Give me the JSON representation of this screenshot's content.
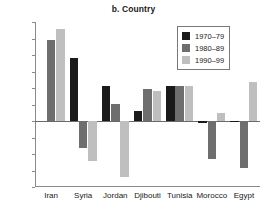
{
  "chart_data": {
    "type": "bar",
    "title": "b. Country",
    "xlabel": "",
    "ylabel": "",
    "ylim": [
      -0.8,
      1.2
    ],
    "ytick_step": 0.2,
    "grid": false,
    "legend_position": "top-right",
    "categories": [
      "Iran",
      "Syria",
      "Jordan",
      "Djibouti",
      "Tunisia",
      "Morocco",
      "Egypt"
    ],
    "ytick_labels": [
      "1.2",
      "1.0",
      "0.8",
      "0.6",
      "0.4",
      "0.2",
      "0",
      "-0.2",
      "-0.4",
      "-0.6",
      "-0.8"
    ],
    "ytick_values": [
      1.2,
      1.0,
      0.8,
      0.6,
      0.4,
      0.2,
      0,
      -0.2,
      -0.4,
      -0.6,
      -0.8
    ],
    "series": [
      {
        "name": "1970-79",
        "color": "#1a1a1a",
        "values": [
          null,
          0.76,
          0.43,
          0.12,
          0.43,
          -0.02,
          0.0
        ]
      },
      {
        "name": "1980-89",
        "color": "#6e6e6e",
        "values": [
          0.98,
          -0.33,
          0.21,
          0.39,
          0.42,
          -0.46,
          -0.57
        ]
      },
      {
        "name": "1990-99",
        "color": "#bfbfbf",
        "values": [
          1.11,
          -0.48,
          -0.68,
          0.36,
          0.43,
          0.1,
          0.47
        ]
      }
    ]
  },
  "legend": {
    "entries": [
      {
        "label": "1970–79",
        "color": "#1a1a1a"
      },
      {
        "label": "1980–89",
        "color": "#6e6e6e"
      },
      {
        "label": "1990–99",
        "color": "#bfbfbf"
      }
    ]
  },
  "colors": {
    "series_1970_79": "#1a1a1a",
    "series_1980_89": "#6e6e6e",
    "series_1990_99": "#bfbfbf",
    "axis": "#8a8a8a",
    "text": "#1a1a1a",
    "background": "#ffffff"
  }
}
